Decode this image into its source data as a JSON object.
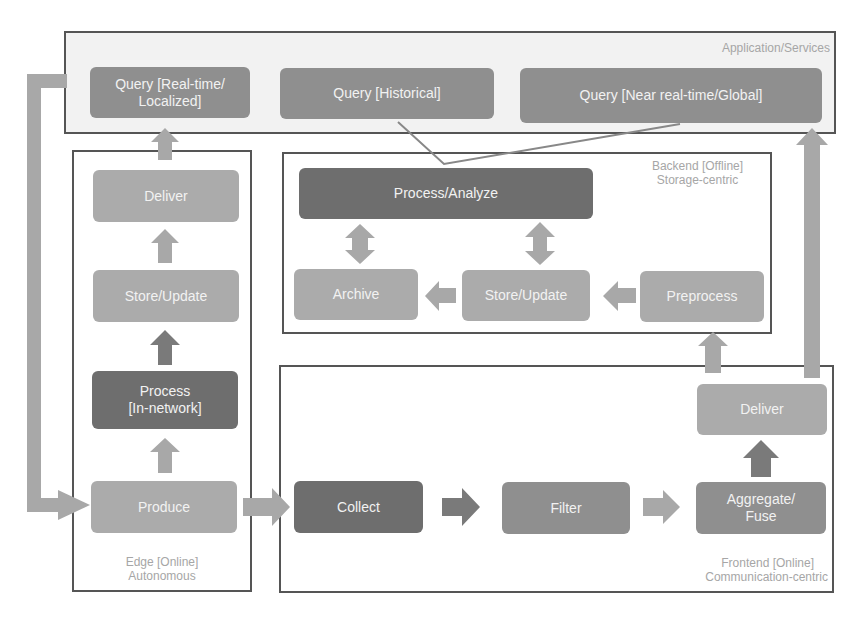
{
  "diagram": {
    "regions": {
      "application": {
        "label": "Application/Services"
      },
      "edge": {
        "label_line1": "Edge [Online]",
        "label_line2": "Autonomous"
      },
      "backend": {
        "label_line1": "Backend [Offline]",
        "label_line2": "Storage-centric"
      },
      "frontend": {
        "label_line1": "Frontend [Online]",
        "label_line2": "Communication-centric"
      }
    },
    "application_nodes": {
      "query_realtime_line1": "Query [Real-time/",
      "query_realtime_line2": "Localized]",
      "query_historical": "Query [Historical]",
      "query_global": "Query [Near real-time/Global]"
    },
    "edge_nodes": {
      "deliver": "Deliver",
      "store_update": "Store/Update",
      "process_line1": "Process",
      "process_line2": "[In-network]",
      "produce": "Produce"
    },
    "backend_nodes": {
      "process_analyze": "Process/Analyze",
      "archive": "Archive",
      "store_update": "Store/Update",
      "preprocess": "Preprocess"
    },
    "frontend_nodes": {
      "collect": "Collect",
      "filter": "Filter",
      "aggregate_line1": "Aggregate/",
      "aggregate_line2": "Fuse",
      "deliver": "Deliver"
    },
    "colors": {
      "dark_node": "#6e6e6e",
      "mid_node": "#8f8f8f",
      "light_node": "#ababab",
      "arrow": "#a8a8a8",
      "arrow_dark": "#7a7a7a",
      "border": "#555555",
      "label": "#a6a6a6"
    }
  }
}
